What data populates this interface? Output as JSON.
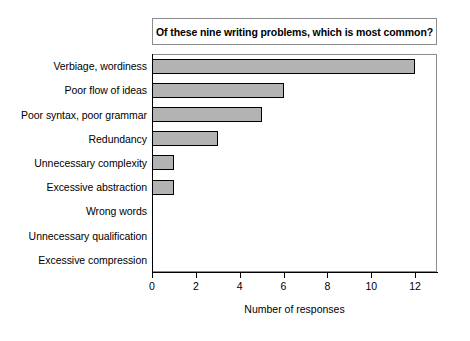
{
  "chart_data": {
    "type": "bar",
    "orientation": "horizontal",
    "title": "Of these nine writing problems, which is most common?",
    "xlabel": "Number of responses",
    "ylabel": "",
    "categories": [
      "Verbiage, wordiness",
      "Poor flow of ideas",
      "Poor syntax, poor grammar",
      "Redundancy",
      "Unnecessary complexity",
      "Excessive abstraction",
      "Wrong words",
      "Unnecessary qualification",
      "Excessive compression"
    ],
    "values": [
      12,
      6,
      5,
      3,
      1,
      1,
      0,
      0,
      0
    ],
    "xlim": [
      0,
      13
    ],
    "xticks": [
      0,
      2,
      4,
      6,
      8,
      10,
      12
    ],
    "grid": false,
    "legend": null,
    "bar_fill_color": "#b3b3b3",
    "bar_edge_color": "#000000",
    "background_color": "#ffffff"
  }
}
